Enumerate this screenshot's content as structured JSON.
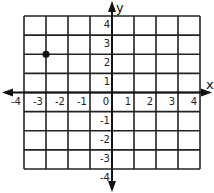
{
  "chart_data": {
    "type": "scatter",
    "title": "",
    "xlabel": "x",
    "ylabel": "y",
    "xlim": [
      -4,
      4
    ],
    "ylim": [
      -4,
      4
    ],
    "grid": true,
    "x_ticks": [
      "-4",
      "-3",
      "-2",
      "-1",
      "0",
      "1",
      "2",
      "3",
      "4"
    ],
    "y_ticks": [
      "-4",
      "-3",
      "-2",
      "-1",
      "1",
      "2",
      "3",
      "4"
    ],
    "series": [
      {
        "name": "point",
        "points": [
          {
            "x": -3,
            "y": 2
          }
        ]
      }
    ]
  },
  "colors": {
    "grid": "#222222",
    "point": "#111111",
    "background": "#ffffff"
  }
}
